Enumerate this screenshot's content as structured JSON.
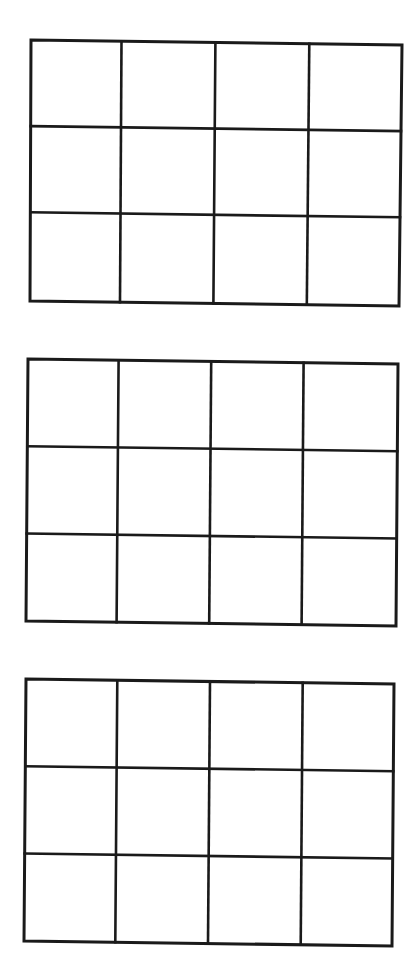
{
  "page": {
    "width": 418,
    "height": 976,
    "background": "#ffffff",
    "line_color": "#1a1a1a",
    "line_width": 2.6
  },
  "grids": [
    {
      "name": "grid-1",
      "rows": 3,
      "cols": 4,
      "corners": {
        "tl": [
          31,
          40
        ],
        "tr": [
          402,
          45
        ],
        "bl": [
          30,
          301
        ],
        "br": [
          399,
          306
        ]
      },
      "col_fracs": [
        0.244,
        0.497,
        0.75
      ],
      "row_fracs": [
        0.33,
        0.66
      ]
    },
    {
      "name": "grid-2",
      "rows": 3,
      "cols": 4,
      "corners": {
        "tl": [
          28,
          359
        ],
        "tr": [
          398,
          364
        ],
        "bl": [
          26,
          621
        ],
        "br": [
          396,
          626
        ]
      },
      "col_fracs": [
        0.245,
        0.495,
        0.745
      ],
      "row_fracs": [
        0.333,
        0.666
      ]
    },
    {
      "name": "grid-3",
      "rows": 3,
      "cols": 4,
      "corners": {
        "tl": [
          26,
          679
        ],
        "tr": [
          394,
          684
        ],
        "bl": [
          24,
          941
        ],
        "br": [
          392,
          946
        ]
      },
      "col_fracs": [
        0.248,
        0.5,
        0.752
      ],
      "row_fracs": [
        0.333,
        0.666
      ]
    }
  ]
}
